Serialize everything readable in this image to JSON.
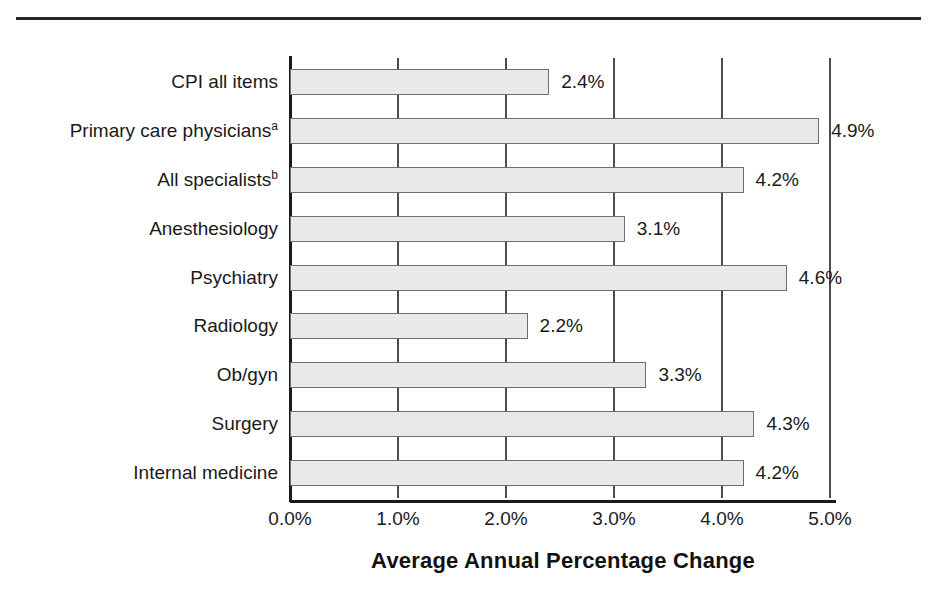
{
  "chart_data": {
    "type": "bar",
    "orientation": "horizontal",
    "title": "",
    "xlabel": "Average Annual Percentage Change",
    "ylabel": "",
    "xlim": [
      0.0,
      5.0
    ],
    "xticks": [
      "0.0%",
      "1.0%",
      "2.0%",
      "3.0%",
      "4.0%",
      "5.0%"
    ],
    "xtick_values": [
      0.0,
      1.0,
      2.0,
      3.0,
      4.0,
      5.0
    ],
    "grid": "vertical",
    "legend": "none",
    "categories": [
      "CPI all items",
      "Primary care physicians",
      "All specialists",
      "Anesthesiology",
      "Psychiatry",
      "Radiology",
      "Ob/gyn",
      "Surgery",
      "Internal medicine"
    ],
    "category_superscripts": [
      "",
      "a",
      "b",
      "",
      "",
      "",
      "",
      "",
      ""
    ],
    "values": [
      2.4,
      4.9,
      4.2,
      3.1,
      4.6,
      2.2,
      3.3,
      4.3,
      4.2
    ],
    "value_labels": [
      "2.4%",
      "4.9%",
      "4.2%",
      "3.1%",
      "4.6%",
      "2.2%",
      "3.3%",
      "4.3%",
      "4.2%"
    ],
    "bar_fill": "#e9e9e9",
    "bar_edge": "#6e6e6e",
    "axis_color": "#1a1a1a"
  }
}
